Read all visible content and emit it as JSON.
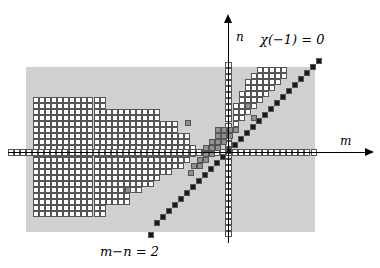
{
  "figure": {
    "title_axis_n": "n",
    "title_axis_m": "m",
    "annotation_chi": "χ(−1) = 0",
    "annotation_diagonal": "m−n = 2",
    "colors": {
      "panel_gray": "#d0d0d0",
      "cell_white_fill": "#ffffff",
      "cell_border": "#555555",
      "cell_gray_fill": "#909090",
      "cell_dark_fill": "#1a1a1a",
      "axis_color": "#000000"
    }
  },
  "chart_data": {
    "type": "scatter",
    "title": "",
    "xlabel": "m",
    "ylabel": "n",
    "grid": true,
    "legend": false,
    "annotations": [
      {
        "text": "χ(−1) = 0",
        "x": 300,
        "y": 40
      },
      {
        "text": "m−n = 2",
        "x": 140,
        "y": 252
      },
      {
        "text": "n",
        "x": 236,
        "y": 38
      },
      {
        "text": "m",
        "x": 340,
        "y": 142
      }
    ],
    "geometry": {
      "panel": {
        "x": 26,
        "y": 67,
        "w": 289,
        "h": 165
      },
      "cell": 6.05,
      "origin": {
        "x": 228.5,
        "y": 152.5
      },
      "axis_n": {
        "x": 228.5,
        "y_top": 22,
        "y_bottom": 243,
        "cells_top": 62,
        "cells_bottom": 243
      },
      "axis_m": {
        "y": 152.5,
        "x_left": 8,
        "x_right": 365,
        "cells_left": 8,
        "cells_right": 318
      }
    },
    "series": [
      {
        "name": "white-cells-left-region",
        "fill": "#ffffff",
        "description": "Stepped region of open cells left of the n-axis spanning above and below the m-axis",
        "rows": [
          {
            "y": 97,
            "x_start": 33,
            "x_end": 100
          },
          {
            "y": 103,
            "x_start": 33,
            "x_end": 100
          },
          {
            "y": 109,
            "x_start": 33,
            "x_end": 160
          },
          {
            "y": 115,
            "x_start": 33,
            "x_end": 160
          },
          {
            "y": 121,
            "x_start": 33,
            "x_end": 178
          },
          {
            "y": 127,
            "x_start": 33,
            "x_end": 178
          },
          {
            "y": 133,
            "x_start": 33,
            "x_end": 190
          },
          {
            "y": 139,
            "x_start": 33,
            "x_end": 190
          },
          {
            "y": 145,
            "x_start": 33,
            "x_end": 196
          },
          {
            "y": 151,
            "x_start": 33,
            "x_end": 196
          },
          {
            "y": 157,
            "x_start": 33,
            "x_end": 190
          },
          {
            "y": 163,
            "x_start": 33,
            "x_end": 184
          },
          {
            "y": 169,
            "x_start": 33,
            "x_end": 172
          },
          {
            "y": 175,
            "x_start": 33,
            "x_end": 160
          },
          {
            "y": 181,
            "x_start": 33,
            "x_end": 148
          },
          {
            "y": 187,
            "x_start": 33,
            "x_end": 136
          },
          {
            "y": 193,
            "x_start": 33,
            "x_end": 124
          },
          {
            "y": 199,
            "x_start": 33,
            "x_end": 124
          },
          {
            "y": 205,
            "x_start": 33,
            "x_end": 100
          },
          {
            "y": 211,
            "x_start": 33,
            "x_end": 100
          }
        ]
      },
      {
        "name": "white-cells-upper-right-block",
        "fill": "#ffffff",
        "description": "Open cells above the diagonal in the first quadrant",
        "rows": [
          {
            "y": 67,
            "x_start": 257,
            "x_end": 287
          },
          {
            "y": 73,
            "x_start": 251,
            "x_end": 287
          },
          {
            "y": 79,
            "x_start": 245,
            "x_end": 281
          },
          {
            "y": 85,
            "x_start": 245,
            "x_end": 275
          },
          {
            "y": 91,
            "x_start": 239,
            "x_end": 269
          },
          {
            "y": 97,
            "x_start": 239,
            "x_end": 263
          },
          {
            "y": 103,
            "x_start": 233,
            "x_end": 257
          },
          {
            "y": 109,
            "x_start": 233,
            "x_end": 251
          },
          {
            "y": 115,
            "x_start": 233,
            "x_end": 245
          },
          {
            "y": 121,
            "x_start": 233,
            "x_end": 239
          }
        ]
      },
      {
        "name": "gray-cells",
        "fill": "#909090",
        "description": "Isolated and clustered shaded cells",
        "points": [
          {
            "x": 185,
            "y": 120
          },
          {
            "x": 188,
            "y": 170
          },
          {
            "x": 125,
            "y": 187
          },
          {
            "x": 245,
            "y": 103
          },
          {
            "x": 251,
            "y": 115
          },
          {
            "x": 215,
            "y": 127
          },
          {
            "x": 221,
            "y": 127
          },
          {
            "x": 227,
            "y": 127
          },
          {
            "x": 233,
            "y": 127
          },
          {
            "x": 215,
            "y": 133
          },
          {
            "x": 221,
            "y": 133
          },
          {
            "x": 227,
            "y": 133
          },
          {
            "x": 209,
            "y": 139
          },
          {
            "x": 215,
            "y": 139
          },
          {
            "x": 221,
            "y": 139
          },
          {
            "x": 203,
            "y": 145
          },
          {
            "x": 209,
            "y": 145
          },
          {
            "x": 215,
            "y": 145
          },
          {
            "x": 203,
            "y": 151
          },
          {
            "x": 209,
            "y": 151
          },
          {
            "x": 197,
            "y": 157
          },
          {
            "x": 203,
            "y": 157
          },
          {
            "x": 191,
            "y": 163
          },
          {
            "x": 197,
            "y": 163
          }
        ]
      },
      {
        "name": "diagonal-m-minus-n-2",
        "fill": "#1a1a1a",
        "description": "Dark filled cells along the line m-n=2",
        "points": [
          {
            "x": 316,
            "y": 58
          },
          {
            "x": 310,
            "y": 64
          },
          {
            "x": 304,
            "y": 70
          },
          {
            "x": 298,
            "y": 76
          },
          {
            "x": 292,
            "y": 82
          },
          {
            "x": 286,
            "y": 88
          },
          {
            "x": 280,
            "y": 94
          },
          {
            "x": 274,
            "y": 100
          },
          {
            "x": 268,
            "y": 106
          },
          {
            "x": 262,
            "y": 112
          },
          {
            "x": 256,
            "y": 118
          },
          {
            "x": 250,
            "y": 124
          },
          {
            "x": 244,
            "y": 130
          },
          {
            "x": 238,
            "y": 136
          },
          {
            "x": 232,
            "y": 142
          },
          {
            "x": 226,
            "y": 148
          },
          {
            "x": 220,
            "y": 154
          },
          {
            "x": 214,
            "y": 160
          },
          {
            "x": 208,
            "y": 166
          },
          {
            "x": 202,
            "y": 172
          },
          {
            "x": 196,
            "y": 178
          },
          {
            "x": 190,
            "y": 184
          },
          {
            "x": 184,
            "y": 190
          },
          {
            "x": 178,
            "y": 196
          },
          {
            "x": 172,
            "y": 202
          },
          {
            "x": 166,
            "y": 208
          },
          {
            "x": 160,
            "y": 214
          },
          {
            "x": 154,
            "y": 220
          },
          {
            "x": 148,
            "y": 232
          }
        ]
      }
    ]
  }
}
